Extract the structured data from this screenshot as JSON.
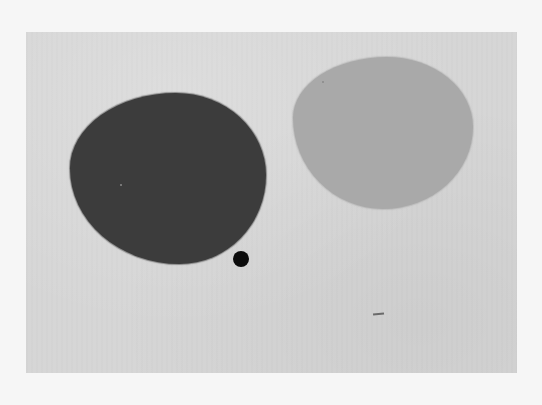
{
  "artwork": {
    "background_color": "#f6f6f6",
    "canvas_color": "#d6d6d6",
    "shapes": [
      {
        "name": "dark-blob",
        "color": "#3c3c3c"
      },
      {
        "name": "light-blob",
        "color": "#a9a9a9"
      },
      {
        "name": "small-dot",
        "color": "#0c0c0c"
      },
      {
        "name": "dash-mark",
        "color": "#6a6a6a"
      }
    ]
  }
}
